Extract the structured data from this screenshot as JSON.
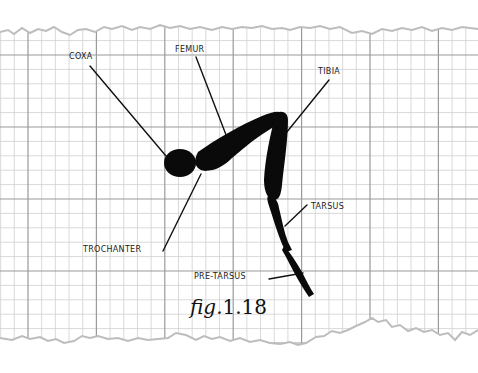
{
  "figure": {
    "caption_prefix": "fig.",
    "caption_number": "1.18"
  },
  "labels": {
    "coxa": "COXA",
    "femur": "FEMUR",
    "tibia": "TIBIA",
    "tarsus": "TARSUS",
    "trochanter": "TROCHANTER",
    "pre_tarsus": "PRE-TARSUS"
  },
  "colors": {
    "paper": "#ffffff",
    "grid_minor": "#c9c9c9",
    "grid_major": "#9a9a9a",
    "ink": "#0a0a0a",
    "torn_edge": "#bdbdbd"
  }
}
